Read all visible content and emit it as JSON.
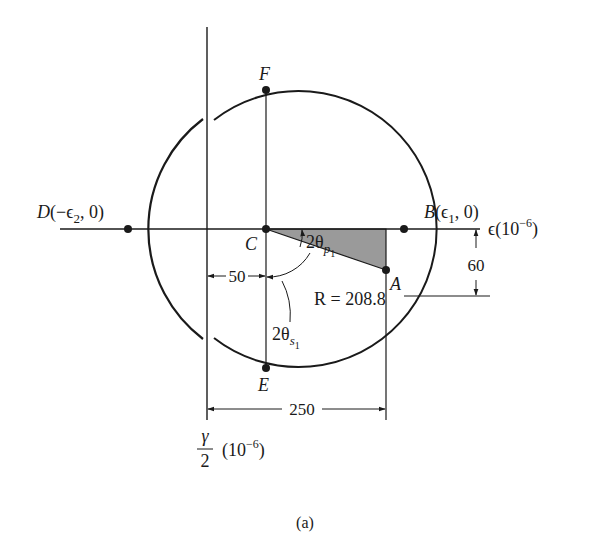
{
  "figure": {
    "caption": "(a)",
    "type": "Mohr's circle for strain",
    "colors": {
      "line": "#1a1a1a",
      "shade": "#9a9a9a",
      "background": "#ffffff"
    }
  },
  "axes": {
    "horizontal": {
      "symbol": "ϵ",
      "unit": "(10",
      "exp": "−6",
      "close": ")"
    },
    "vertical": {
      "num": "γ",
      "den": "2",
      "unit": "(10",
      "exp": "−6",
      "close": ")"
    }
  },
  "points": {
    "C": {
      "label": "C"
    },
    "A": {
      "label": "A"
    },
    "B": {
      "label": "B",
      "coord_open": "(ϵ",
      "coord_sub": "1",
      "coord_close": ", 0)"
    },
    "D": {
      "label": "D",
      "coord_open": "(−ϵ",
      "coord_sub": "2",
      "coord_close": ", 0)"
    },
    "E": {
      "label": "E"
    },
    "F": {
      "label": "F"
    }
  },
  "dimensions": {
    "center_offset": "50",
    "A_x": "250",
    "A_y": "60",
    "radius": "R = 208.8"
  },
  "angles": {
    "principal": {
      "prefix": "2θ",
      "sub": "p",
      "subsub": "1"
    },
    "shear": {
      "prefix": "2θ",
      "sub": "s",
      "subsub": "1"
    }
  }
}
